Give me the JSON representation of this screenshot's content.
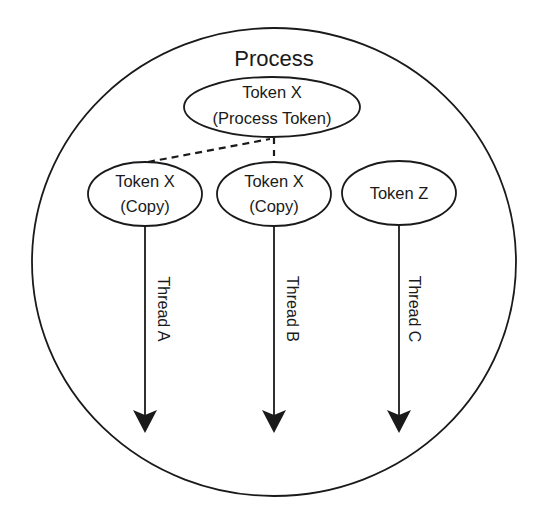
{
  "diagram": {
    "title": "Process",
    "colors": {
      "stroke": "#1a1a1a",
      "background": "#ffffff"
    },
    "process_token": {
      "line1": "Token X",
      "line2": "(Process Token)"
    },
    "tokens": [
      {
        "line1": "Token X",
        "line2": "(Copy)",
        "relation": "copy of process token (dashed link)"
      },
      {
        "line1": "Token X",
        "line2": "(Copy)",
        "relation": "copy of process token (dashed link)"
      },
      {
        "line1": "Token Z",
        "line2": "",
        "relation": "independent token"
      }
    ],
    "threads": [
      {
        "label": "Thread A"
      },
      {
        "label": "Thread B"
      },
      {
        "label": "Thread C"
      }
    ]
  }
}
